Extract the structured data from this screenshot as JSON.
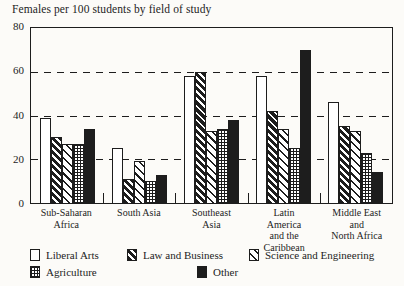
{
  "colors": {
    "ink": "#1d1d1d",
    "paper": "#fcfbf8",
    "bar_fill_white": "#ffffff",
    "bar_fill_black": "#1d1d1d"
  },
  "chart_data": {
    "type": "bar",
    "title": "Females per 100 students by field of study",
    "xlabel": "",
    "ylabel": "",
    "ylim": [
      0,
      80
    ],
    "yticks": [
      "80",
      "60",
      "40",
      "20",
      "0"
    ],
    "grid": "dashed horizontal lines at 20, 40, 60",
    "legend_position": "bottom",
    "categories": [
      "Sub-Saharan\nAfrica",
      "South Asia",
      "Southeast\nAsia",
      "Latin\nAmerica\nand the\nCaribbean",
      "Middle East\nand\nNorth Africa"
    ],
    "series": [
      {
        "name": "Liberal Arts",
        "pattern": "plain-white",
        "values": [
          39,
          25,
          58,
          58,
          46
        ]
      },
      {
        "name": "Law and Business",
        "pattern": "dense-diagonal",
        "values": [
          30,
          11,
          60,
          42,
          35
        ]
      },
      {
        "name": "Science and Engineering",
        "pattern": "light-diagonal",
        "values": [
          27,
          19,
          33,
          34,
          33
        ]
      },
      {
        "name": "Agriculture",
        "pattern": "grid-dots",
        "values": [
          27,
          10,
          34,
          25,
          23
        ]
      },
      {
        "name": "Other",
        "pattern": "solid-black",
        "values": [
          34,
          13,
          38,
          70,
          14
        ]
      }
    ]
  },
  "legend": {
    "items": [
      {
        "label": "Liberal Arts"
      },
      {
        "label": "Law and Business"
      },
      {
        "label": "Science and Engineering"
      },
      {
        "label": "Agriculture"
      },
      {
        "label": "Other"
      }
    ]
  }
}
